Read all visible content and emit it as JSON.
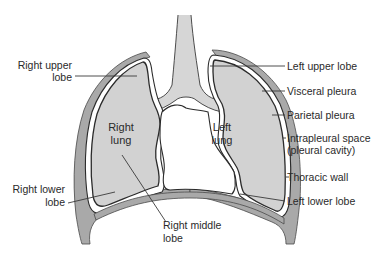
{
  "diagram": {
    "title": "",
    "colors": {
      "thoracic_wall": "#a9a9a9",
      "lung_fill": "#d2d2d2",
      "outline": "#2b2b2b",
      "text": "#2a2a2a",
      "background": "#ffffff"
    },
    "labels": {
      "right_upper_lobe": [
        "Right upper",
        "lobe"
      ],
      "right_lung": [
        "Right",
        "lung"
      ],
      "left_lung": [
        "Left",
        "lung"
      ],
      "right_lower_lobe": [
        "Right lower",
        "lobe"
      ],
      "right_middle_lobe": [
        "Right middle",
        "lobe"
      ],
      "left_upper_lobe": "Left upper lobe",
      "visceral_pleura": "Visceral pleura",
      "parietal_pleura": "Parietal pleura",
      "intrapleural_space": [
        "Intrapleural space",
        "(pleural cavity)"
      ],
      "thoracic_wall": "Thoracic wall",
      "left_lower_lobe": "Left lower lobe"
    },
    "structures": [
      "trachea",
      "bronchi",
      "right-lung",
      "left-lung",
      "visceral-pleura",
      "parietal-pleura",
      "thoracic-wall",
      "diaphragm",
      "mediastinum"
    ]
  }
}
